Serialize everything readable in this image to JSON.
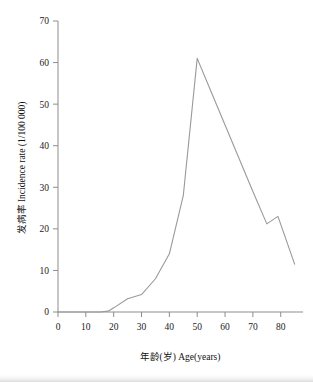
{
  "chart_data": {
    "type": "line",
    "title": "",
    "subtitle": "",
    "xlabel": "年龄(岁) Age(years)",
    "ylabel": "发病率 Incidence rate (1/100 000)",
    "xlim": [
      0,
      88
    ],
    "ylim": [
      0,
      70
    ],
    "grid": false,
    "legend": "none",
    "xticks": [
      0,
      10,
      20,
      30,
      40,
      50,
      60,
      70,
      80
    ],
    "xtick_labels": [
      "0",
      "10",
      "20",
      "30",
      "40",
      "50",
      "60",
      "70",
      "80"
    ],
    "yticks": [
      0,
      10,
      20,
      30,
      40,
      50,
      60,
      70
    ],
    "ytick_labels": [
      "0",
      "10",
      "20",
      "30",
      "40",
      "50",
      "60",
      "70"
    ],
    "series": [
      {
        "name": "Incidence rate",
        "color": "#9a9a9a",
        "x": [
          0,
          5,
          10,
          15,
          18,
          20,
          25,
          30,
          35,
          40,
          45,
          50,
          55,
          60,
          65,
          70,
          75,
          79,
          85
        ],
        "values": [
          0,
          0,
          0,
          0,
          0.2,
          1.0,
          3.2,
          4.2,
          8.0,
          14.0,
          28.0,
          61.0,
          53.0,
          45.0,
          37.0,
          29.0,
          21.2,
          23.0,
          11.5
        ]
      }
    ],
    "annotations": []
  },
  "axes": {
    "x_axis_name": "age-axis",
    "y_axis_name": "incidence-rate-axis"
  }
}
